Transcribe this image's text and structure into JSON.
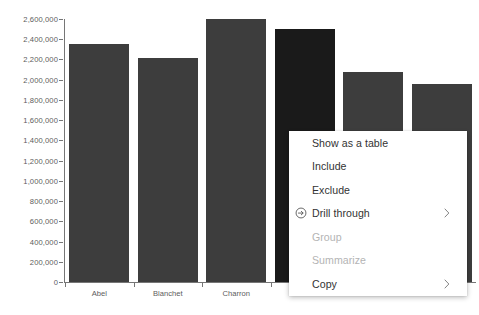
{
  "chart_data": {
    "type": "bar",
    "title": "",
    "xlabel": "",
    "ylabel": "",
    "ylim": [
      0,
      2600000
    ],
    "grid": false,
    "legend": null,
    "categories": [
      "Abel",
      "Blanchet",
      "Charron",
      "",
      "",
      ""
    ],
    "visible_categories": [
      "Abel",
      "Blanchet",
      "Charron"
    ],
    "values": [
      2350000,
      2210000,
      2600000,
      2500000,
      2080000,
      1960000
    ],
    "selected_index": 3,
    "y_tick_labels": [
      "2,600,000",
      "2,400,000",
      "2,200,000",
      "2,000,000",
      "1,800,000",
      "1,600,000",
      "1,400,000",
      "1,200,000",
      "1,000,000",
      "800,000",
      "600,000",
      "400,000",
      "200,000",
      "0"
    ],
    "y_tick_values": [
      2600000,
      2400000,
      2200000,
      2000000,
      1800000,
      1600000,
      1400000,
      1200000,
      1000000,
      800000,
      600000,
      400000,
      200000,
      0
    ],
    "colors": {
      "bar": "#3d3d3d",
      "bar_selected": "#1a1a1a",
      "axis": "#767676",
      "tick_text": "#5c5c5c",
      "background": "#ffffff"
    }
  },
  "context_menu": {
    "items": [
      {
        "label": "Show as a table",
        "disabled": false,
        "icon": null,
        "submenu": false
      },
      {
        "label": "Include",
        "disabled": false,
        "icon": null,
        "submenu": false
      },
      {
        "label": "Exclude",
        "disabled": false,
        "icon": null,
        "submenu": false
      },
      {
        "label": "Drill through",
        "disabled": false,
        "icon": "circle-arrow-right-icon",
        "submenu": true
      },
      {
        "label": "Group",
        "disabled": true,
        "icon": null,
        "submenu": false
      },
      {
        "label": "Summarize",
        "disabled": true,
        "icon": null,
        "submenu": false
      },
      {
        "label": "Copy",
        "disabled": false,
        "icon": null,
        "submenu": true
      }
    ],
    "colors": {
      "text": "#333333",
      "text_disabled": "#b4b4b4",
      "background": "#ffffff"
    }
  }
}
